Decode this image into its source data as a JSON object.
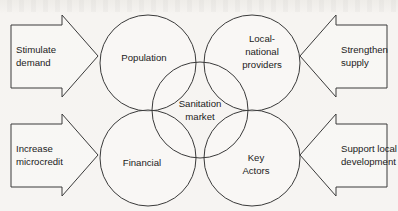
{
  "diagram": {
    "type": "venn-style-overlap-diagram",
    "canvas": {
      "width": 398,
      "height": 211
    },
    "background_color": "#f5f3f0",
    "stroke_color": "#3a3a3a",
    "text_color": "#1b1b1b",
    "center": {
      "label_line1": "Sanitation",
      "label_line2": "market",
      "cx": 200,
      "cy": 110,
      "r": 48
    },
    "circles": [
      {
        "id": "population",
        "label_line1": "Population",
        "label_line2": "",
        "cx": 148,
        "cy": 63,
        "r": 48
      },
      {
        "id": "local-national-providers",
        "label_line1": "Local-",
        "label_line2": "national",
        "label_line3": "providers",
        "cx": 252,
        "cy": 63,
        "r": 48
      },
      {
        "id": "financial",
        "label_line1": "Financial",
        "label_line2": "",
        "cx": 148,
        "cy": 158,
        "r": 48
      },
      {
        "id": "key-actors",
        "label_line1": "Key",
        "label_line2": "Actors",
        "cx": 252,
        "cy": 158,
        "r": 48
      }
    ],
    "arrows": [
      {
        "id": "stimulate-demand",
        "direction": "right",
        "label_line1": "Stimulate",
        "label_line2": "demand"
      },
      {
        "id": "strengthen-supply",
        "direction": "left",
        "label_line1": "Strengthen",
        "label_line2": "supply"
      },
      {
        "id": "increase-microcredit",
        "direction": "right",
        "label_line1": "Increase",
        "label_line2": "microcredit"
      },
      {
        "id": "support-local-development",
        "direction": "left",
        "label_line1": "Support local",
        "label_line2": "development"
      }
    ]
  }
}
